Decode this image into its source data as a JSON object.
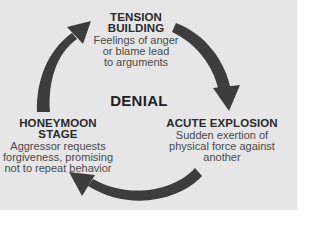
{
  "diagram": {
    "center_label": "DENIAL",
    "stages": [
      {
        "id": "tension",
        "title_lines": [
          "TENSION",
          "BUILDING"
        ],
        "description_lines": [
          "Feelings of anger",
          "or blame lead",
          "to arguments"
        ]
      },
      {
        "id": "acute",
        "title_lines": [
          "ACUTE EXPLOSION"
        ],
        "description_lines": [
          "Sudden exertion of",
          "physical force against",
          "another"
        ]
      },
      {
        "id": "honeymoon",
        "title_lines": [
          "HONEYMOON STAGE"
        ],
        "description_lines": [
          "Aggressor requests",
          "forgiveness, promising",
          "not to repeat behavior"
        ]
      }
    ],
    "arrows": [
      {
        "from": "honeymoon",
        "to": "tension",
        "direction": "clockwise"
      },
      {
        "from": "tension",
        "to": "acute",
        "direction": "clockwise"
      },
      {
        "from": "acute",
        "to": "honeymoon",
        "direction": "clockwise"
      }
    ],
    "colors": {
      "background": "#e6e6e6",
      "arrow": "#3d3d3d",
      "title_text": "#2a2a2a",
      "body_text": "#4a4a4a"
    }
  }
}
